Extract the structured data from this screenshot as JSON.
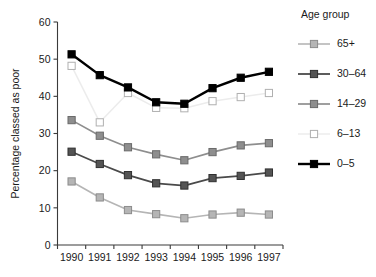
{
  "chart_data": {
    "type": "line",
    "title": "",
    "xlabel": "",
    "ylabel": "Percentage classed as poor",
    "categories": [
      "1990",
      "1991",
      "1992",
      "1993",
      "1994",
      "1995",
      "1996",
      "1997"
    ],
    "x": [
      1990,
      1991,
      1992,
      1993,
      1994,
      1995,
      1996,
      1997
    ],
    "ylim": [
      0,
      60
    ],
    "yticks": [
      0,
      10,
      20,
      30,
      40,
      50,
      60
    ],
    "ytick_labels": [
      "0",
      "10",
      "20",
      "30",
      "40",
      "50",
      "60"
    ],
    "grid": false,
    "legend_position": "right",
    "legend_title": "Age group",
    "series": [
      {
        "name": "65+",
        "values": [
          17.1,
          12.8,
          9.4,
          8.3,
          7.2,
          8.2,
          8.7,
          8.2
        ],
        "color": "#b5b5b5",
        "marker_fill": "#b5b5b5",
        "marker_edge": "#8c8c8c",
        "line_width": 1.6
      },
      {
        "name": "30–64",
        "values": [
          25.1,
          21.8,
          18.8,
          16.6,
          16.0,
          18.0,
          18.6,
          19.5
        ],
        "color": "#4a4a4a",
        "marker_fill": "#545454",
        "marker_edge": "#303030",
        "line_width": 1.8
      },
      {
        "name": "14–29",
        "values": [
          33.6,
          29.4,
          26.3,
          24.4,
          22.8,
          25.0,
          26.8,
          27.4
        ],
        "color": "#8e8e8e",
        "marker_fill": "#8e8e8e",
        "marker_edge": "#6a6a6a",
        "line_width": 1.7
      },
      {
        "name": "6–13",
        "values": [
          48.2,
          33.0,
          40.9,
          36.9,
          36.8,
          38.7,
          39.8,
          40.9
        ],
        "color": "#ececec",
        "marker_fill": "#ffffff",
        "marker_edge": "#b0b0b0",
        "line_width": 1.5
      },
      {
        "name": "0–5",
        "values": [
          51.3,
          45.7,
          42.4,
          38.4,
          38.0,
          42.2,
          45.0,
          46.6
        ],
        "color": "#000000",
        "marker_fill": "#000000",
        "marker_edge": "#000000",
        "line_width": 2.4
      }
    ]
  },
  "legend": {
    "title": "Age group",
    "items": [
      {
        "label": "65+"
      },
      {
        "label": "30–64"
      },
      {
        "label": "14–29"
      },
      {
        "label": "6–13"
      },
      {
        "label": "0–5"
      }
    ]
  }
}
